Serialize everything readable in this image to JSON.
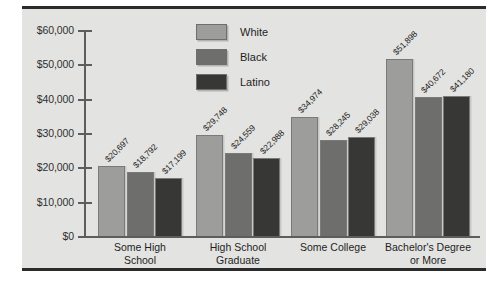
{
  "chart_data": {
    "type": "bar",
    "title": "",
    "subtitle": "",
    "xlabel": "",
    "ylabel": "",
    "ylim": [
      0,
      60000
    ],
    "grid": false,
    "legend_position": "top-center",
    "categories": [
      "Some High School",
      "High School Graduate",
      "Some College",
      "Bachelor's Degree or More"
    ],
    "category_lines": [
      [
        "Some High",
        "School"
      ],
      [
        "High School",
        "Graduate"
      ],
      [
        "Some College",
        ""
      ],
      [
        "Bachelor's Degree",
        "or More"
      ]
    ],
    "ytick_labels": [
      "$60,000",
      "$50,000",
      "$40,000",
      "$30,000",
      "$20,000",
      "$10,000",
      "$0"
    ],
    "ytick_values": [
      60000,
      50000,
      40000,
      30000,
      20000,
      10000,
      0
    ],
    "series": [
      {
        "name": "White",
        "color": "#9d9d9b",
        "values": [
          20697,
          29748,
          34974,
          51898
        ],
        "labels": [
          "$20,697",
          "$29,748",
          "$34,974",
          "$51,898"
        ]
      },
      {
        "name": "Black",
        "color": "#6e6e6c",
        "values": [
          18792,
          24559,
          28245,
          40672
        ],
        "labels": [
          "$18,792",
          "$24,559",
          "$28,245",
          "$40,672"
        ]
      },
      {
        "name": "Latino",
        "color": "#373736",
        "values": [
          17199,
          22988,
          29038,
          41180
        ],
        "labels": [
          "$17,199",
          "$22,988",
          "$29,038",
          "$41,180"
        ]
      }
    ]
  },
  "legend": {
    "entries": [
      {
        "label": "White",
        "color": "#9d9d9b"
      },
      {
        "label": "Black",
        "color": "#6e6e6c"
      },
      {
        "label": "Latino",
        "color": "#373736"
      }
    ]
  },
  "colors": {
    "panel_background": "#e3e3e1",
    "axis": "#5d5d5d",
    "rule": "#2b2b2b",
    "text": "#1f1f1f"
  }
}
